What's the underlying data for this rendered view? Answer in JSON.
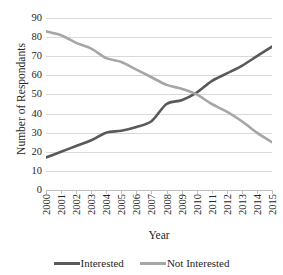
{
  "chart_data": {
    "type": "line",
    "title": "",
    "xlabel": "Year",
    "ylabel": "Number of Respondants",
    "categories": [
      "2000",
      "2001",
      "2002",
      "2003",
      "2004",
      "2005",
      "2006",
      "2007",
      "2008",
      "2009",
      "2010",
      "2011",
      "2012",
      "2013",
      "2014",
      "2015"
    ],
    "x": [
      2000,
      2001,
      2002,
      2003,
      2004,
      2005,
      2006,
      2007,
      2008,
      2009,
      2010,
      2011,
      2012,
      2013,
      2014,
      2015
    ],
    "ylim": [
      0,
      90
    ],
    "ytick_labels": [
      "90",
      "80",
      "70",
      "60",
      "50",
      "40",
      "30",
      "20",
      "10",
      "0"
    ],
    "ytick_values": [
      90,
      80,
      70,
      60,
      50,
      40,
      30,
      20,
      10,
      0
    ],
    "ystep": 10,
    "grid": "horizontal",
    "legend_position": "bottom",
    "series": [
      {
        "name": "Interested",
        "color": "#595959",
        "values": [
          17,
          20,
          23,
          26,
          30,
          31,
          33,
          36,
          45,
          47,
          51,
          57,
          61,
          65,
          70,
          75
        ]
      },
      {
        "name": "Not Interested",
        "color": "#a6a6a6",
        "values": [
          83,
          81,
          77,
          74,
          69,
          67,
          63,
          59,
          55,
          53,
          50,
          45,
          41,
          36,
          30,
          25
        ]
      }
    ],
    "annotations": [
      "Interested and Not Interested series cross near 2009-2010 at about 50 respondants."
    ]
  },
  "axis": {
    "line_color": "#bfbfbf",
    "grid_color": "#d9d9d9"
  },
  "legend": {
    "items": [
      {
        "label": "Interested",
        "color": "#595959",
        "icon": "line-swatch-icon"
      },
      {
        "label": "Not Interested",
        "color": "#a6a6a6",
        "icon": "line-swatch-icon"
      }
    ]
  }
}
